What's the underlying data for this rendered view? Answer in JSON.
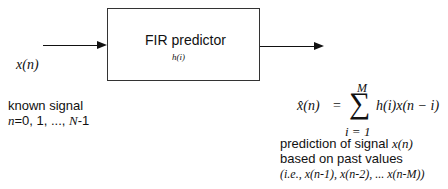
{
  "block": {
    "title": "FIR predictor",
    "subtitle": "h(i)"
  },
  "input": {
    "signal_label": "x(n)",
    "description_line1": "known signal",
    "description_line2_prefix": "n",
    "description_line2_mid": "=0, 1, ..., ",
    "description_line2_N": "N",
    "description_line2_suffix": "-1"
  },
  "output": {
    "equation": {
      "lhs": "x̂(n)",
      "equals": "=",
      "sum_symbol": "∑",
      "upper_limit": "M",
      "lower_limit": "i = 1",
      "summand": "h(i)x(n − i)"
    },
    "description_line1_text": "prediction of signal ",
    "description_line1_var": "x(n)",
    "description_line2": "based on past values",
    "description_line3": "(i.e., x(n-1), x(n-2), ... x(n-M))"
  }
}
